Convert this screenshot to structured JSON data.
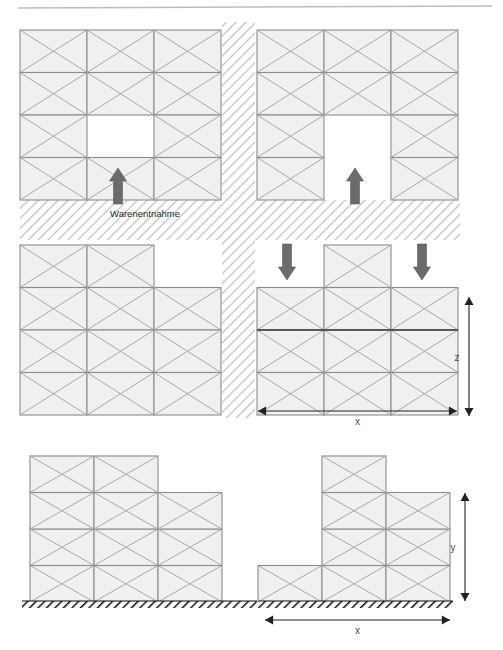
{
  "diagram": {
    "title_rule": "top-horizontal-rule",
    "labels": {
      "warenentnahme": "Warenentnahme",
      "axis_x_top": "x",
      "axis_z_top": "z",
      "axis_x_bottom": "x",
      "axis_y_bottom": "y"
    },
    "colors": {
      "cell_fill": "#f0f0f0",
      "cell_stroke": "#8c8c8c",
      "block_outline": "#6e6e6e",
      "diagonal": "#a8a8a8",
      "aisle_hatch": "#b9b9b9",
      "ground_hatch": "#1a1a1a",
      "arrow_fill": "#6b6b6b",
      "dim_line": "#222222",
      "rule": "#bdbdbd",
      "accent_dark_line": "#3c3c3c"
    },
    "geometry": {
      "cell_w": 67,
      "cell_h": 42.5,
      "cell_w_elev": 64,
      "cell_h_elev": 36.5
    },
    "plan_view": {
      "description": "top plan view: four rack blocks separated by hatched aisles",
      "blocks": [
        {
          "name": "plan-block-top-left",
          "x": 20,
          "y": 30,
          "cols": 3,
          "rows": 4,
          "missing_cells": [
            [
              3,
              2
            ]
          ]
        },
        {
          "name": "plan-block-top-right",
          "x": 257,
          "y": 30,
          "cols": 3,
          "rows": 4,
          "missing_cells": [
            [
              3,
              2
            ],
            [
              4,
              2
            ]
          ]
        },
        {
          "name": "plan-block-bottom-left",
          "x": 20,
          "y": 245,
          "cols": 3,
          "rows": 4,
          "missing_cells": [
            [
              1,
              3
            ]
          ]
        },
        {
          "name": "plan-block-bottom-right",
          "x": 257,
          "y": 245,
          "cols": 3,
          "rows": 4,
          "missing_cells": [
            [
              1,
              1
            ],
            [
              1,
              3
            ]
          ],
          "dark_row_line": 3
        }
      ],
      "aisles": [
        {
          "name": "vertical-aisle",
          "x": 222,
          "y": 22,
          "w": 33,
          "h": 195
        },
        {
          "name": "horizontal-aisle",
          "x": 20,
          "y": 200,
          "w": 440,
          "h": 40
        },
        {
          "name": "vertical-aisle-lower",
          "x": 222,
          "y": 240,
          "w": 33,
          "h": 178
        }
      ],
      "arrows": [
        {
          "name": "arrow-up-left-block",
          "dir": "up",
          "x": 118,
          "y": 168,
          "len": 36
        },
        {
          "name": "arrow-up-right-block",
          "dir": "up",
          "x": 355,
          "y": 168,
          "len": 36
        },
        {
          "name": "arrow-down-left",
          "dir": "down",
          "x": 287,
          "y": 244,
          "len": 36
        },
        {
          "name": "arrow-down-right",
          "dir": "down",
          "x": 422,
          "y": 244,
          "len": 36
        }
      ],
      "dimensions": [
        {
          "name": "dim-z",
          "orient": "vertical",
          "label": "z",
          "x": 469,
          "y1": 297,
          "y2": 416
        },
        {
          "name": "dim-x",
          "orient": "horizontal",
          "label": "x",
          "y": 411,
          "x1": 258,
          "x2": 457
        }
      ]
    },
    "elevation_view": {
      "description": "bottom: two side elevations standing on hatched ground",
      "ground_lines": [
        {
          "name": "ground-hatch-left",
          "x": 22,
          "y": 601,
          "w": 235
        },
        {
          "name": "ground-hatch-right",
          "x": 258,
          "y": 601,
          "w": 195
        }
      ],
      "blocks": [
        {
          "name": "elevation-block-left",
          "x": 30,
          "y": 456,
          "cols": 3,
          "rows": 4,
          "column_heights": [
            4,
            4,
            3
          ]
        },
        {
          "name": "elevation-block-right",
          "x": 258,
          "y": 456,
          "cols": 3,
          "rows": 4,
          "column_heights": [
            1,
            4,
            3
          ]
        }
      ],
      "dimensions": [
        {
          "name": "dim-y",
          "orient": "vertical",
          "label": "y",
          "x": 465,
          "y1": 493,
          "y2": 601
        },
        {
          "name": "dim-x-elev",
          "orient": "horizontal",
          "label": "x",
          "y": 620,
          "x1": 265,
          "x2": 450
        }
      ]
    }
  }
}
